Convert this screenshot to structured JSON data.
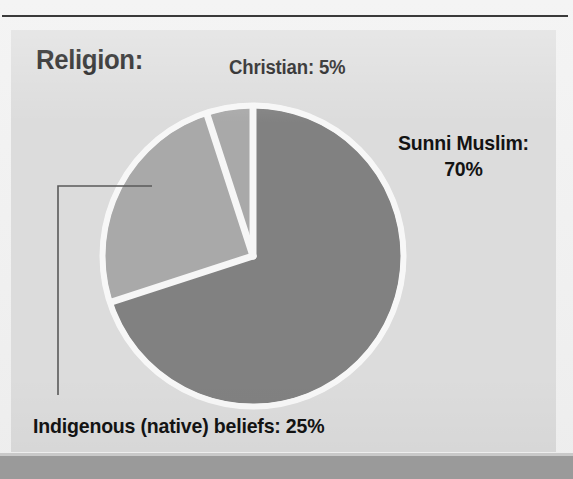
{
  "page": {
    "background_color": "#f1f1f1",
    "panel_color": "#dcdcdc",
    "rule_color": "#3a3a3a",
    "footer_color": "#9a9a9a"
  },
  "chart_data": {
    "type": "pie",
    "title": "Religion:",
    "xlabel": "",
    "ylabel": "",
    "legend_position": "callout-labels",
    "grid": false,
    "unit": "%",
    "categories": [
      "Sunni Muslim",
      "Indigenous (native) beliefs",
      "Christian"
    ],
    "values": [
      70,
      25,
      5
    ],
    "colors": [
      "#818181",
      "#a9a9a9",
      "#a9a9a9"
    ],
    "slice_separator_color": "#f6f6f6",
    "start_angle_deg": 0,
    "direction": "clockwise",
    "slices": [
      {
        "name": "Sunni Muslim",
        "value": 70,
        "label": "Sunni Muslim:",
        "value_label": "70%",
        "color": "#818181",
        "start_deg": 0,
        "end_deg": 252
      },
      {
        "name": "Indigenous (native) beliefs",
        "value": 25,
        "label": "Indigenous (native) beliefs: 25%",
        "value_label": "25%",
        "color": "#a9a9a9",
        "start_deg": 252,
        "end_deg": 342
      },
      {
        "name": "Christian",
        "value": 5,
        "label": "Christian: 5%",
        "value_label": "5%",
        "color": "#a9a9a9",
        "start_deg": 342,
        "end_deg": 360
      }
    ],
    "annotations": [
      {
        "name": "indigenous-leader-line",
        "type": "elbow-line",
        "color": "#5a5a5a",
        "points": "152,186 58,186 58,395"
      }
    ]
  },
  "labels": {
    "title": "Religion:",
    "christian": "Christian: 5%",
    "sunni_line1": "Sunni Muslim:",
    "sunni_line2": "70%",
    "indigenous": "Indigenous (native) beliefs: 25%"
  }
}
